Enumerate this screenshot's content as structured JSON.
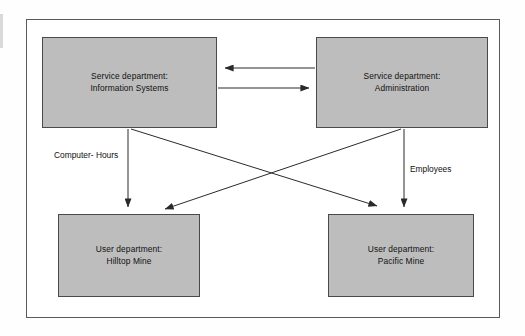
{
  "diagram": {
    "frame_color": "#5a5a5a",
    "node_fill": "#bdbdbd",
    "node_border": "#4a4a4a",
    "arrow_color": "#2a2a2a",
    "nodes": [
      {
        "id": "information-systems",
        "line1": "Service department:",
        "line2": "Information Systems"
      },
      {
        "id": "administration",
        "line1": "Service department:",
        "line2": "Administration"
      },
      {
        "id": "hilltop-mine",
        "line1": "User department:",
        "line2": "Hilltop Mine"
      },
      {
        "id": "pacific-mine",
        "line1": "User department:",
        "line2": "Pacific Mine"
      }
    ],
    "edge_labels": {
      "computer_hours_line1": "Computer-",
      "computer_hours_line2": "Hours",
      "employees": "Employees"
    },
    "edges": [
      {
        "id": "admin-to-is",
        "from": "administration",
        "to": "information-systems",
        "direction": "left",
        "style": "horizontal"
      },
      {
        "id": "is-to-admin",
        "from": "information-systems",
        "to": "administration",
        "direction": "right",
        "style": "horizontal"
      },
      {
        "id": "is-to-hilltop",
        "from": "information-systems",
        "to": "hilltop-mine",
        "direction": "down",
        "style": "vertical",
        "label": "Computer-Hours"
      },
      {
        "id": "is-to-pacific",
        "from": "information-systems",
        "to": "pacific-mine",
        "direction": "down-right",
        "style": "diagonal"
      },
      {
        "id": "admin-to-hilltop",
        "from": "administration",
        "to": "hilltop-mine",
        "direction": "down-left",
        "style": "diagonal"
      },
      {
        "id": "admin-to-pacific",
        "from": "administration",
        "to": "pacific-mine",
        "direction": "down",
        "style": "vertical",
        "label": "Employees"
      }
    ]
  }
}
